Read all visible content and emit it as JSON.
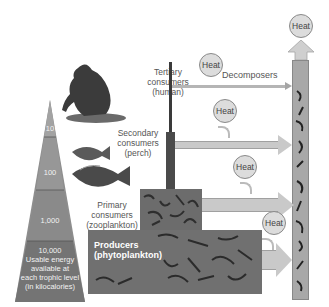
{
  "pyramid": {
    "levels": [
      {
        "value": "10"
      },
      {
        "value": "100"
      },
      {
        "value": "1,000"
      },
      {
        "value": "10,000",
        "caption_lines": [
          "Usable energy",
          "available at",
          "each trophic level",
          "(in kilocalories)"
        ]
      }
    ]
  },
  "trophic_levels": [
    {
      "lines": [
        "Tertiary",
        "consumers",
        "(human)"
      ]
    },
    {
      "lines": [
        "Secondary",
        "consumers",
        "(perch)"
      ]
    },
    {
      "lines": [
        "Primary",
        "consumers",
        "(zooplankton)"
      ]
    },
    {
      "lines": [
        "Producers",
        "(phytoplankton)"
      ]
    }
  ],
  "decomposers_label": "Decomposers",
  "heat_label": "Heat",
  "colors": {
    "pyramid_top": "#9a9a9a",
    "pyramid_bottom": "#6e6e6e",
    "arrow_fill": "#c9c9c9",
    "heat_circle": "#dcdcdc",
    "decomposer_column": "#a8a8a8"
  }
}
